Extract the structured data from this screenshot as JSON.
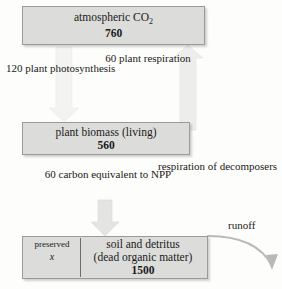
{
  "diagram": {
    "background_color": "#fdfdfb",
    "box_fill_color": "#dcdcda",
    "box_border_color": "#9a9a98",
    "arrow_color": "#e2e2e0",
    "boxes": {
      "atmosphere": {
        "label": "atmospheric CO",
        "subscript": "2",
        "value": "760"
      },
      "biomass": {
        "label": "plant biomass (living)",
        "value": "560"
      },
      "soil": {
        "line1": "soil and detritus",
        "line2": "(dead organic matter)",
        "value": "1500",
        "preserved_label": "preserved",
        "preserved_value": "x"
      }
    },
    "flux_labels": {
      "photosynthesis": {
        "value": "120",
        "line1": "plant",
        "line2": "photosynthesis"
      },
      "plant_respiration": {
        "value": "60",
        "line1": "plant",
        "line2": "respiration"
      },
      "npp": {
        "value": "60",
        "line1": "carbon equivalent",
        "line2": "to NPP"
      },
      "decomposer_respiration": {
        "line1": "respiration of",
        "line2": "decomposers"
      },
      "runoff": {
        "label": "runoff"
      }
    }
  }
}
